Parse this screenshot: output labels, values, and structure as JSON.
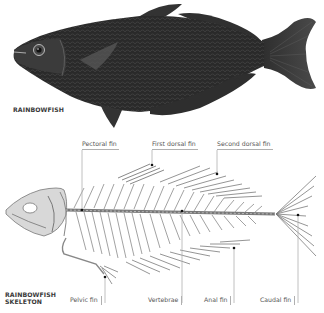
{
  "figure": {
    "top": {
      "title": "RAINBOWFISH",
      "description": "Dark scaled illustration of a rainbowfish, facing left"
    },
    "bottom": {
      "title_line1": "RAINBOWFISH",
      "title_line2": "SKELETON",
      "description": "Grey line illustration of a rainbowfish skeleton, facing left"
    },
    "labels": {
      "pectoral_fin": "Pectoral fin",
      "first_dorsal_fin": "First dorsal fin",
      "second_dorsal_fin": "Second dorsal fin",
      "pelvic_fin": "Pelvic fin",
      "vertebrae": "Vertebrae",
      "anal_fin": "Anal fin",
      "caudal_fin": "Caudal fin"
    },
    "colors": {
      "fish_body": "#2b2b2b",
      "skeleton": "#8a8a8a",
      "label_text": "#555555",
      "leader_line": "#b0b0b0"
    }
  }
}
